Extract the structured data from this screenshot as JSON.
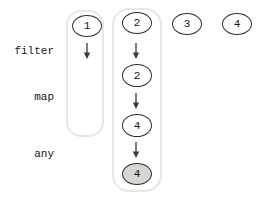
{
  "diagram": {
    "rows": [
      {
        "label": "filter"
      },
      {
        "label": "map"
      },
      {
        "label": "any"
      }
    ],
    "columns": [
      {
        "input": "1"
      },
      {
        "input": "2",
        "after_filter": "2",
        "after_map": "4",
        "result": "4"
      },
      {
        "input": "3"
      },
      {
        "input": "4"
      }
    ],
    "colors": {
      "node_stroke": "#2f2f2f",
      "lane_stroke": "#e8e7e2",
      "result_fill": "#d8d7d1",
      "text": "#151515",
      "background": "#ffffff"
    }
  }
}
